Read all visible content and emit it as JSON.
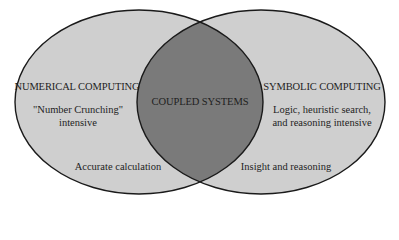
{
  "diagram": {
    "type": "venn",
    "colors": {
      "background": "#ffffff",
      "set_fill": "#cfcfcf",
      "overlap_fill": "#7a7a7a",
      "outline": "#1a1a1a",
      "text": "#1e1e1e"
    },
    "left_set": {
      "title": "NUMERICAL COMPUTING",
      "description_line1": "\"Number Crunching\"",
      "description_line2": "intensive",
      "footer": "Accurate calculation"
    },
    "overlap": {
      "title": "COUPLED SYSTEMS"
    },
    "right_set": {
      "title": "SYMBOLIC COMPUTING",
      "description_line1": "Logic, heuristic search,",
      "description_line2": "and reasoning intensive",
      "footer": "Insight and reasoning"
    }
  }
}
